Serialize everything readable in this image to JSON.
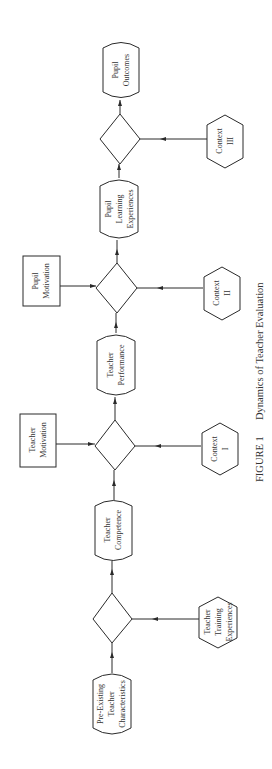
{
  "figure": {
    "caption_label": "FIGURE 1",
    "caption_title": "Dynamics of Teacher Evaluation",
    "orientation": "rotated -90 degrees (flow reads bottom to top)"
  },
  "nodes": {
    "pre_existing": {
      "shape": "terminator",
      "lines": [
        "Pre-Existing",
        "Teacher",
        "Characteristics"
      ]
    },
    "training": {
      "shape": "hexagon",
      "lines": [
        "Teacher",
        "Training",
        "Experiences"
      ]
    },
    "competence": {
      "shape": "terminator",
      "lines": [
        "Teacher",
        "Competence"
      ]
    },
    "teacher_motivation": {
      "shape": "rectangle",
      "lines": [
        "Teacher",
        "Motivation"
      ]
    },
    "context1": {
      "shape": "hexagon",
      "lines": [
        "Context",
        "I"
      ]
    },
    "performance": {
      "shape": "terminator",
      "lines": [
        "Teacher",
        "Performance"
      ]
    },
    "pupil_motivation": {
      "shape": "rectangle",
      "lines": [
        "Pupil",
        "Motivation"
      ]
    },
    "context2": {
      "shape": "hexagon",
      "lines": [
        "Context",
        "II"
      ]
    },
    "pupil_learning": {
      "shape": "terminator",
      "lines": [
        "Pupil",
        "Learning",
        "Experiences"
      ]
    },
    "context3": {
      "shape": "hexagon",
      "lines": [
        "Context",
        "III"
      ]
    },
    "pupil_outcomes": {
      "shape": "terminator",
      "lines": [
        "Pupil",
        "Outcomes"
      ]
    }
  },
  "edges": [
    [
      "Pre-Existing Teacher Characteristics",
      "Decision 1"
    ],
    [
      "Teacher Training Experiences",
      "Decision 1"
    ],
    [
      "Decision 1",
      "Teacher Competence"
    ],
    [
      "Teacher Competence",
      "Decision 2"
    ],
    [
      "Teacher Motivation",
      "Decision 2"
    ],
    [
      "Context I",
      "Decision 2"
    ],
    [
      "Decision 2",
      "Teacher Performance"
    ],
    [
      "Teacher Performance",
      "Decision 3"
    ],
    [
      "Pupil Motivation",
      "Decision 3"
    ],
    [
      "Context II",
      "Decision 3"
    ],
    [
      "Decision 3",
      "Pupil Learning Experiences"
    ],
    [
      "Pupil Learning Experiences",
      "Decision 4"
    ],
    [
      "Context III",
      "Decision 4"
    ],
    [
      "Decision 4",
      "Pupil Outcomes"
    ]
  ],
  "colors": {
    "stroke": "#2a2a2a",
    "background": "#ffffff",
    "text": "#333333"
  }
}
